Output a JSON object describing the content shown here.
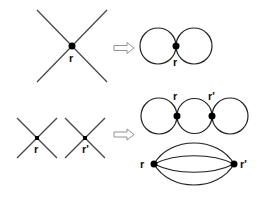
{
  "diagram": {
    "top_row": {
      "vertex": {
        "label": "r"
      },
      "arrow": "open-right-arrow",
      "result": {
        "type": "figure-eight",
        "label": "r"
      }
    },
    "bottom_row": {
      "vertices": [
        {
          "label": "r"
        },
        {
          "label": "r'"
        }
      ],
      "arrow": "open-right-arrow",
      "results": [
        {
          "type": "three-loop-chain",
          "labels": [
            "r",
            "r'"
          ]
        },
        {
          "type": "four-propagator-sunset",
          "labels": [
            "r",
            "r'"
          ]
        }
      ]
    }
  }
}
